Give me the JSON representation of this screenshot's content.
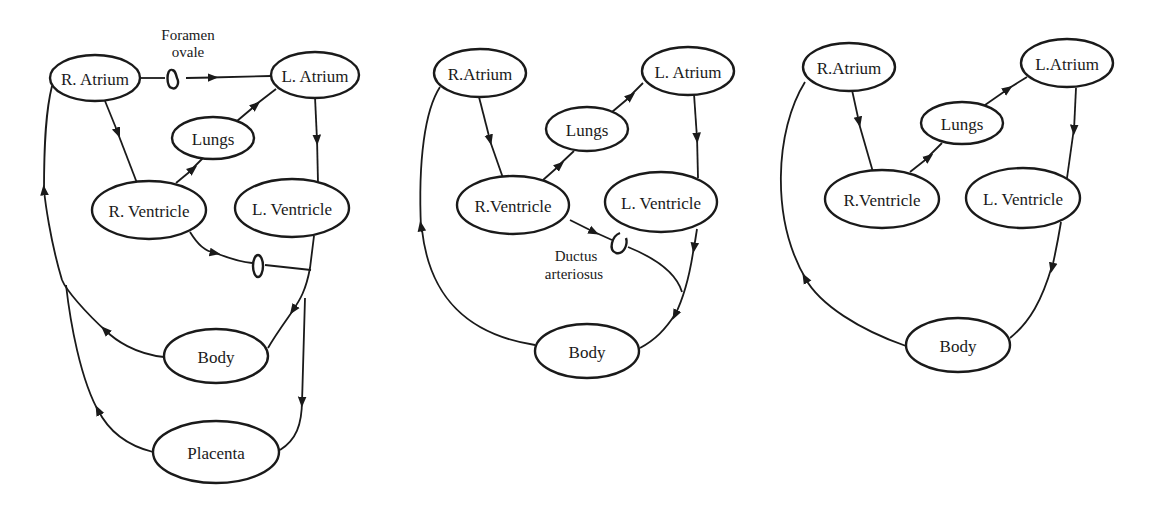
{
  "diagrams": [
    {
      "id": "fetal-circulation",
      "nodes": {
        "r_atrium": "R. Atrium",
        "l_atrium": "L. Atrium",
        "lungs": "Lungs",
        "r_ventricle": "R. Ventricle",
        "l_ventricle": "L. Ventricle",
        "body": "Body",
        "placenta": "Placenta"
      },
      "annotations": {
        "foramen_line1": "Foramen",
        "foramen_line2": "ovale"
      }
    },
    {
      "id": "transitional-circulation",
      "nodes": {
        "r_atrium": "R.Atrium",
        "l_atrium": "L. Atrium",
        "lungs": "Lungs",
        "r_ventricle": "R.Ventricle",
        "l_ventricle": "L. Ventricle",
        "body": "Body"
      },
      "annotations": {
        "ductus_line1": "Ductus",
        "ductus_line2": "arteriosus"
      }
    },
    {
      "id": "adult-circulation",
      "nodes": {
        "r_atrium": "R.Atrium",
        "l_atrium": "L.Atrium",
        "lungs": "Lungs",
        "r_ventricle": "R.Ventricle",
        "l_ventricle": "L. Ventricle",
        "body": "Body"
      }
    }
  ],
  "colors": {
    "ink": "#1a1a1a",
    "paper": "#ffffff"
  }
}
